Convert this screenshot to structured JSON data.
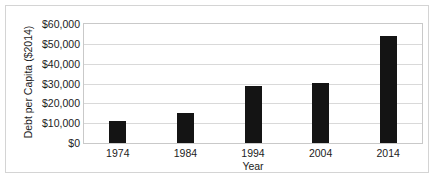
{
  "chart_data": {
    "type": "bar",
    "title": "",
    "xlabel": "Year",
    "ylabel": "Debt per Capita ($2014)",
    "categories": [
      "1974",
      "1984",
      "1994",
      "2004",
      "2014"
    ],
    "values": [
      11000,
      15000,
      28500,
      30300,
      54000
    ],
    "ylim": [
      0,
      60000
    ],
    "ytick_values": [
      0,
      10000,
      20000,
      30000,
      40000,
      50000,
      60000
    ],
    "ytick_labels": [
      "$0",
      "$10,000",
      "$20,000",
      "$30,000",
      "$40,000",
      "$50,000",
      "$60,000"
    ],
    "grid": true,
    "legend": false,
    "bar_color": "#141414",
    "gridline_color": "#d9d9d9",
    "plot_border_color": "#c9c9c9",
    "frame_border_color": "#d4d4d4",
    "background_color": "#ffffff"
  }
}
